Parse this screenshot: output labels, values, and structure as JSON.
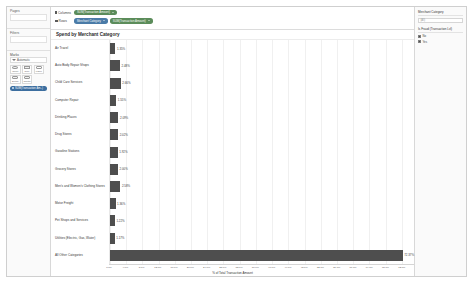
{
  "sidebar": {
    "pages_label": "Pages",
    "filters_label": "Filters",
    "marks_label": "Marks",
    "mark_type": "Automatic",
    "buttons": [
      {
        "label": "Color",
        "icon": "color-icon"
      },
      {
        "label": "Size",
        "icon": "size-icon"
      },
      {
        "label": "Label",
        "icon": "label-icon"
      },
      {
        "label": "Detail",
        "icon": "detail-icon"
      },
      {
        "label": "Tooltip",
        "icon": "tooltip-icon"
      }
    ],
    "mark_pill": "SUM(Transaction Am..)"
  },
  "shelves": {
    "columns_label": "Columns",
    "rows_label": "Rows",
    "columns_pills": [
      {
        "text": "SUM(Transaction Amount)",
        "color": "green"
      }
    ],
    "rows_pills": [
      {
        "text": "Merchant Category",
        "color": "blue"
      },
      {
        "text": "SUM(Transaction Amount)",
        "color": "green"
      }
    ]
  },
  "right_panel": {
    "cards": [
      {
        "title": "Merchant Category",
        "search_placeholder": "(All)",
        "items": []
      },
      {
        "title": "Is Fraud (Transaction Lvl)",
        "search_placeholder": "",
        "items": [
          {
            "label": "No",
            "checked": true
          },
          {
            "label": "Yes",
            "checked": true
          }
        ]
      }
    ]
  },
  "chart_data": {
    "type": "bar",
    "orientation": "horizontal",
    "title": "Spend by Merchant Category",
    "xlabel": "% of Total Transaction Amount",
    "ylabel": "",
    "xlim": [
      0,
      75
    ],
    "grid": true,
    "categories": [
      "Air Travel",
      "Auto Body Repair Shops",
      "Child Care Services",
      "Computer Repair",
      "Drinking Places",
      "Drug Stores",
      "Gasoline Stations",
      "Grocery Stores",
      "Men's and Women's Clothing Stores",
      "Motor Freight",
      "Pet Shops and Services",
      "Utilities (Electric, Gas, Water)",
      "All Other Categories"
    ],
    "values": [
      1.35,
      2.48,
      2.66,
      1.55,
      2.09,
      2.02,
      1.92,
      2.0,
      2.58,
      1.36,
      1.22,
      1.17,
      72.37
    ],
    "value_labels": [
      "1.35%",
      "2.48%",
      "2.66%",
      "1.55%",
      "2.09%",
      "2.02%",
      "1.92%",
      "2.00%",
      "2.58%",
      "1.36%",
      "1.22%",
      "1.17%",
      "72.37%"
    ],
    "bar_color": "#4e4e4e",
    "ticks": [
      "0.0%",
      "4.0%",
      "8.0%",
      "12.0%",
      "16.0%",
      "20.0%",
      "24.0%",
      "28.0%",
      "32.0%",
      "36.0%",
      "40.0%",
      "44.0%",
      "48.0%",
      "52.0%",
      "56.0%",
      "60.0%",
      "64.0%",
      "68.0%",
      "72.0%"
    ],
    "tick_values": [
      0,
      4,
      8,
      12,
      16,
      20,
      24,
      28,
      32,
      36,
      40,
      44,
      48,
      52,
      56,
      60,
      64,
      68,
      72
    ]
  }
}
